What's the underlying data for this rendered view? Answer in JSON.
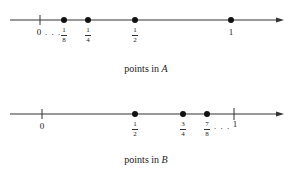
{
  "diagram_a": {
    "caption_prefix": "points in",
    "set_name": "A",
    "start_label": "0",
    "ellipsis": ". . .",
    "points": [
      {
        "num": "1",
        "den": "8",
        "value": 0.125
      },
      {
        "num": "1",
        "den": "4",
        "value": 0.25
      },
      {
        "num": "1",
        "den": "2",
        "value": 0.5
      },
      {
        "label": "1",
        "value": 1
      }
    ]
  },
  "diagram_b": {
    "caption_prefix": "points in",
    "set_name": "B",
    "start_label": "0",
    "ellipsis": ". . .",
    "end_label": "1",
    "points": [
      {
        "num": "1",
        "den": "2",
        "value": 0.5
      },
      {
        "num": "3",
        "den": "4",
        "value": 0.75
      },
      {
        "num": "7",
        "den": "8",
        "value": 0.875
      }
    ]
  },
  "colors": {
    "line": "#333333",
    "dot": "#111111",
    "text": "#222222"
  }
}
